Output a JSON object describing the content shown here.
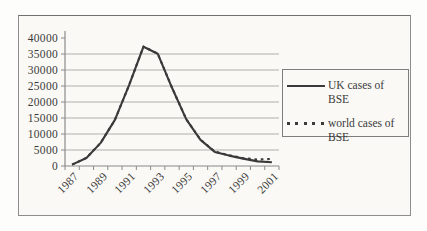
{
  "chart_data": {
    "type": "line",
    "title": "",
    "xlabel": "",
    "ylabel": "",
    "categories": [
      "1987",
      "1988",
      "1989",
      "1990",
      "1991",
      "1992",
      "1993",
      "1994",
      "1995",
      "1996",
      "1997",
      "1998",
      "1999",
      "2000",
      "2001"
    ],
    "x_tick_labels": [
      "1987",
      "1989",
      "1991",
      "1993",
      "1995",
      "1997",
      "1999",
      "2001"
    ],
    "y_ticks": [
      0,
      5000,
      10000,
      15000,
      20000,
      25000,
      30000,
      35000,
      40000
    ],
    "ylim": [
      0,
      40000
    ],
    "grid": "horizontal",
    "legend_position": "right",
    "series": [
      {
        "name": "UK cases of BSE",
        "line_style": "solid",
        "color": "#3a3a3a",
        "values": [
          442,
          2514,
          7228,
          14407,
          25359,
          37280,
          35090,
          24438,
          14562,
          8149,
          4393,
          3235,
          2301,
          1443,
          1202
        ]
      },
      {
        "name": "world cases of BSE",
        "line_style": "dashed",
        "color": "#3a3a3a",
        "values": [
          446,
          2520,
          7240,
          14420,
          25390,
          37320,
          35140,
          24500,
          14640,
          8230,
          4500,
          3350,
          2450,
          2030,
          2230
        ]
      }
    ],
    "colors": {
      "gridline": "#b2afaa",
      "axis": "#8a8a8a",
      "paper": "#faf9f6",
      "frame_border": "#8d8d8d"
    }
  }
}
